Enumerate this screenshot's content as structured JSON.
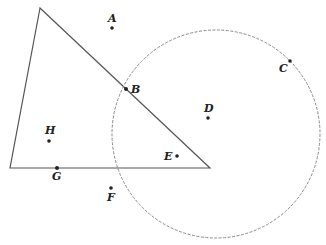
{
  "diagram": {
    "colors": {
      "triangle_stroke": "#555555",
      "circle_stroke": "#888888",
      "point_fill": "#222222",
      "label": "#222222"
    },
    "points": [
      {
        "id": "A",
        "label": "A",
        "relation": "outside both"
      },
      {
        "id": "B",
        "label": "B",
        "relation": "on triangle edge and on circle"
      },
      {
        "id": "C",
        "label": "C",
        "relation": "on circle"
      },
      {
        "id": "D",
        "label": "D",
        "relation": "inside circle"
      },
      {
        "id": "E",
        "label": "E",
        "relation": "inside triangle and circle"
      },
      {
        "id": "F",
        "label": "F",
        "relation": "outside both"
      },
      {
        "id": "G",
        "label": "G",
        "relation": "on triangle edge"
      },
      {
        "id": "H",
        "label": "H",
        "relation": "inside triangle"
      }
    ]
  }
}
